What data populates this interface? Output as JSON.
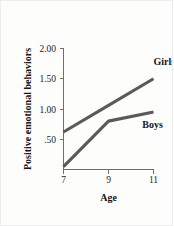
{
  "figure": {
    "background_color": "#fdfdfc",
    "border_color": "#ededed",
    "line_color": "#5a5a5a",
    "axis_color": "#6e6e6e",
    "text_color": "#151515"
  },
  "chart_data": {
    "type": "line",
    "title": "",
    "subtitle": "",
    "xlabel": "Age",
    "ylabel": "Positive emotional behaviors",
    "x": [
      7,
      9,
      11
    ],
    "xticklabels": [
      "7",
      "9",
      "11"
    ],
    "yticks": [
      0.5,
      1.0,
      1.5,
      2.0
    ],
    "yticklabels": [
      ".50",
      "1.00",
      "1.50",
      "2.00"
    ],
    "xlim": [
      6.4,
      11.6
    ],
    "ylim": [
      0.0,
      2.15
    ],
    "grid": false,
    "legend": "inline-labels",
    "legend_position": "right-of-line-ends",
    "series": [
      {
        "name": "Girls",
        "label": "Girls",
        "values": [
          0.62,
          1.06,
          1.5
        ],
        "color": "#5a5a5a",
        "label_x": 11.0,
        "label_y": 1.72
      },
      {
        "name": "Boys",
        "label": "Boys",
        "values": [
          0.05,
          0.8,
          0.95
        ],
        "color": "#5a5a5a",
        "label_x": 10.95,
        "label_y": 0.68
      }
    ],
    "annotations": []
  }
}
